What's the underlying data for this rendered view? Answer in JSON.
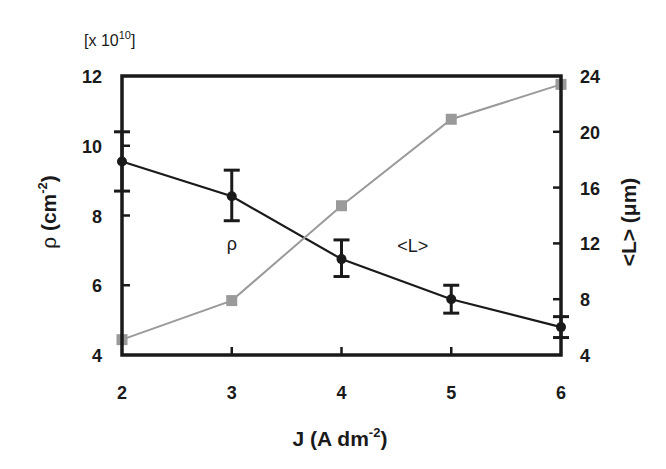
{
  "chart_data": {
    "type": "line",
    "title": "",
    "xlabel": "J (A dm-2)",
    "xlabel_parts": {
      "main": "J (A dm",
      "sup": "-2",
      "close": ")"
    },
    "x": [
      2,
      3,
      4,
      5,
      6
    ],
    "xticks": [
      2,
      3,
      4,
      5,
      6
    ],
    "xlim": [
      2,
      6
    ],
    "y_left": {
      "label": "ρ (cm-2)",
      "label_parts": {
        "main": "ρ (cm",
        "sup": "-2",
        "close": ")"
      },
      "multiplier": "[x 10^10]",
      "multiplier_parts": {
        "main": "[x 10",
        "sup": "10",
        "close": "]"
      },
      "ticks": [
        4,
        6,
        8,
        10,
        12
      ],
      "lim": [
        4,
        12
      ]
    },
    "y_right": {
      "label": "<L> (μm)",
      "ticks": [
        4,
        8,
        12,
        16,
        20,
        24
      ],
      "lim": [
        4,
        24
      ]
    },
    "series": [
      {
        "name": "ρ",
        "axis": "left",
        "color": "#1a1a1a",
        "marker": "circle",
        "values": [
          9.55,
          8.55,
          6.75,
          5.6,
          4.8
        ],
        "error_low": [
          8.7,
          7.85,
          6.25,
          5.2,
          4.5
        ],
        "error_high": [
          10.4,
          9.3,
          7.3,
          6.0,
          5.1
        ]
      },
      {
        "name": "<L>",
        "axis": "right",
        "color": "#9a9a9a",
        "marker": "square",
        "values": [
          5.1,
          7.9,
          14.7,
          20.9,
          23.4
        ]
      }
    ],
    "annotations": [
      {
        "text": "ρ",
        "x": 3.0,
        "y_left": 7.0
      },
      {
        "text": "<L>",
        "x": 4.65,
        "y_left": 6.95
      }
    ],
    "grid": false,
    "legend": "none (inline labels)"
  }
}
